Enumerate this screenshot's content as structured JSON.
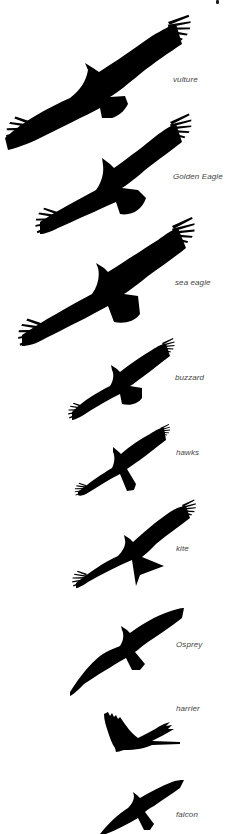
{
  "figure": {
    "background": "#ffffff",
    "silhouette_color": "#000000",
    "label_color": "#444444"
  },
  "birds": [
    {
      "id": "vulture",
      "label": "vulture",
      "label_pos": [
        173,
        75
      ]
    },
    {
      "id": "golden-eagle",
      "label": "Golden Eagle",
      "label_pos": [
        173,
        172
      ]
    },
    {
      "id": "sea-eagle",
      "label": "sea eagle",
      "label_pos": [
        175,
        278
      ]
    },
    {
      "id": "buzzard",
      "label": "buzzard",
      "label_pos": [
        175,
        373
      ]
    },
    {
      "id": "hawks",
      "label": "hawks",
      "label_pos": [
        176,
        448
      ]
    },
    {
      "id": "kite",
      "label": "kite",
      "label_pos": [
        176,
        544
      ]
    },
    {
      "id": "osprey",
      "label": "Osprey",
      "label_pos": [
        176,
        640
      ]
    },
    {
      "id": "harrier",
      "label": "harrier",
      "label_pos": [
        176,
        704
      ]
    },
    {
      "id": "falcon",
      "label": "falcon",
      "label_pos": [
        176,
        810
      ]
    }
  ]
}
